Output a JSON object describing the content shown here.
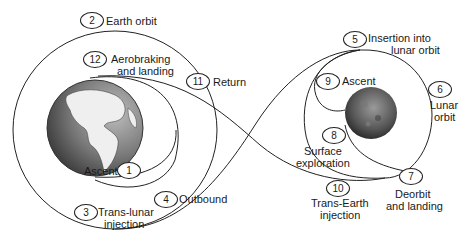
{
  "diagram": {
    "steps": [
      {
        "n": "1",
        "label": "Ascent"
      },
      {
        "n": "2",
        "label": "Earth orbit"
      },
      {
        "n": "3",
        "label_line1": "Trans-lunar",
        "label_line2": "injection"
      },
      {
        "n": "4",
        "label": "Outbound"
      },
      {
        "n": "5",
        "label_line1": "Insertion into",
        "label_line2": "lunar orbit"
      },
      {
        "n": "6",
        "label_line1": "Lunar",
        "label_line2": "orbit"
      },
      {
        "n": "7",
        "label_line1": "Deorbit",
        "label_line2": "and landing"
      },
      {
        "n": "8",
        "label_line1": "Surface",
        "label_line2": "exploration"
      },
      {
        "n": "9",
        "label": "Ascent"
      },
      {
        "n": "10",
        "label_line1": "Trans-Earth",
        "label_line2": "injection"
      },
      {
        "n": "11",
        "label": "Return"
      },
      {
        "n": "12",
        "label_line1": "Aerobraking",
        "label_line2": "and landing"
      }
    ],
    "bodies": {
      "earth": "Earth globe",
      "moon": "Moon"
    },
    "colors": {
      "line": "#222222",
      "earth_dark": "#4a4a4a",
      "earth_land": "#f2f2f2",
      "moon_dark": "#2a2a2a",
      "moon_light": "#8a8a8a"
    }
  }
}
